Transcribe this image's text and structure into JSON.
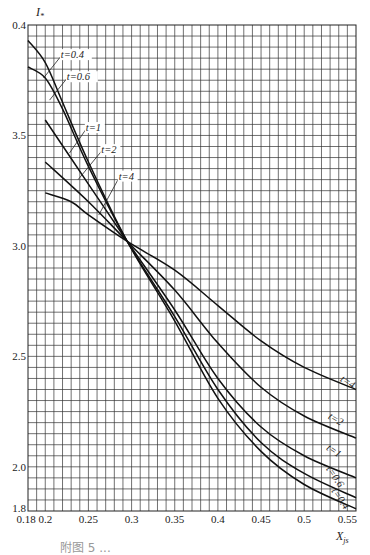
{
  "chart_data": {
    "type": "line",
    "title": "",
    "xlabel": "X_js",
    "ylabel": "I_*",
    "xlim": [
      0.18,
      0.56
    ],
    "ylim": [
      1.8,
      4.0
    ],
    "grid": true,
    "x_ticks": [
      0.18,
      0.2,
      0.25,
      0.3,
      0.35,
      0.4,
      0.45,
      0.5,
      0.55
    ],
    "x_tick_labels": [
      "0.18",
      "0.2",
      "0.25",
      "0.3",
      "0.35",
      "0.4",
      "0.45",
      "0.5",
      "0.55"
    ],
    "y_ticks": [
      1.8,
      2.0,
      2.5,
      3.0,
      3.5,
      4.0
    ],
    "y_tick_labels": [
      "1.8",
      "2.0",
      "2.5",
      "3.0",
      "3.5",
      "0.4"
    ],
    "grid_step_x": 0.01,
    "grid_step_y": 0.05,
    "legend": "inline curve labels",
    "series": [
      {
        "name": "t=0.4",
        "x": [
          0.18,
          0.2,
          0.22,
          0.25,
          0.295,
          0.35,
          0.4,
          0.45,
          0.5,
          0.56
        ],
        "y": [
          3.93,
          3.83,
          3.65,
          3.38,
          3.02,
          2.66,
          2.31,
          2.07,
          1.92,
          1.81
        ]
      },
      {
        "name": "t=0.6",
        "x": [
          0.18,
          0.2,
          0.22,
          0.25,
          0.295,
          0.35,
          0.4,
          0.45,
          0.5,
          0.56
        ],
        "y": [
          3.81,
          3.76,
          3.62,
          3.36,
          3.02,
          2.68,
          2.35,
          2.11,
          1.97,
          1.86
        ]
      },
      {
        "name": "t=1",
        "x": [
          0.2,
          0.25,
          0.295,
          0.35,
          0.4,
          0.45,
          0.5,
          0.56
        ],
        "y": [
          3.57,
          3.28,
          3.02,
          2.71,
          2.4,
          2.18,
          2.05,
          1.95
        ]
      },
      {
        "name": "t=2",
        "x": [
          0.2,
          0.25,
          0.295,
          0.35,
          0.4,
          0.45,
          0.5,
          0.56
        ],
        "y": [
          3.38,
          3.2,
          3.02,
          2.8,
          2.56,
          2.36,
          2.23,
          2.13
        ]
      },
      {
        "name": "t=4",
        "x": [
          0.2,
          0.23,
          0.25,
          0.295,
          0.35,
          0.4,
          0.45,
          0.5,
          0.56
        ],
        "y": [
          3.24,
          3.2,
          3.14,
          3.02,
          2.89,
          2.73,
          2.57,
          2.45,
          2.35
        ]
      }
    ],
    "annotations": [
      {
        "text": "t=0.4",
        "x": 0.218,
        "y": 3.85,
        "leader_to": [
          0.198,
          3.76
        ],
        "side": "left"
      },
      {
        "text": "t=0.6",
        "x": 0.225,
        "y": 3.75,
        "leader_to": [
          0.205,
          3.66
        ],
        "side": "left"
      },
      {
        "text": "t=1",
        "x": 0.247,
        "y": 3.52,
        "leader_to": [
          0.228,
          3.42
        ],
        "side": "left"
      },
      {
        "text": "t=2",
        "x": 0.265,
        "y": 3.42,
        "leader_to": [
          0.238,
          3.3
        ],
        "side": "left"
      },
      {
        "text": "t=4",
        "x": 0.285,
        "y": 3.3,
        "leader_to": [
          0.262,
          3.14
        ],
        "side": "left"
      },
      {
        "text": "t=4",
        "x": 0.541,
        "y": 2.39,
        "side": "right",
        "rotate": 33
      },
      {
        "text": "t=2",
        "x": 0.527,
        "y": 2.22,
        "side": "right",
        "rotate": 30
      },
      {
        "text": "t=1",
        "x": 0.525,
        "y": 2.08,
        "side": "right",
        "rotate": 35
      },
      {
        "text": "t=0.6",
        "x": 0.525,
        "y": 1.99,
        "side": "right",
        "rotate": 55
      },
      {
        "text": "t=0.4",
        "x": 0.531,
        "y": 1.89,
        "side": "right",
        "rotate": 55
      }
    ]
  },
  "caption": "附图 5 ..."
}
